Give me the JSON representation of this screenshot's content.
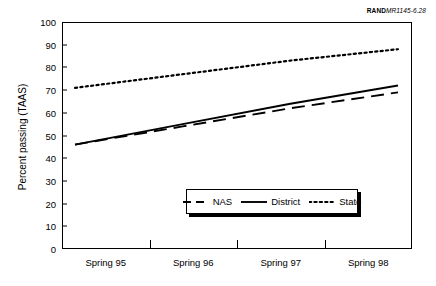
{
  "credit": {
    "organization": "RAND",
    "document_number": "MR1145-6.28"
  },
  "chart_data": {
    "type": "line",
    "title": "",
    "xlabel": "",
    "ylabel": "Percent passing (TAAS)",
    "categories": [
      "Spring 95",
      "Spring 96",
      "Spring 97",
      "Spring 98"
    ],
    "ylim": [
      0,
      100
    ],
    "yticks": [
      0,
      10,
      20,
      30,
      40,
      50,
      60,
      70,
      80,
      90,
      100
    ],
    "grid": false,
    "legend_position": "inside-bottom-center",
    "series": [
      {
        "name": "NAS",
        "style": "dashed",
        "color": "#000000",
        "values": [
          46,
          54,
          62,
          69
        ]
      },
      {
        "name": "District",
        "style": "solid",
        "color": "#000000",
        "values": [
          46,
          55,
          64,
          72
        ]
      },
      {
        "name": "State",
        "style": "dotted",
        "color": "#000000",
        "values": [
          71,
          77,
          83,
          88
        ]
      }
    ]
  }
}
